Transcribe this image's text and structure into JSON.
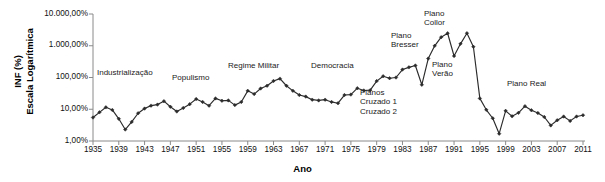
{
  "chart_data": {
    "type": "line",
    "title": "",
    "xlabel": "Ano",
    "ylabel": "INF (%)\nEscala Logarítmica",
    "ylabel_lines": [
      "INF (%)",
      "Escala Logarítmica"
    ],
    "yscale": "log",
    "ylim": [
      1,
      10000
    ],
    "xlim": [
      1935,
      2011
    ],
    "grid": false,
    "legend": null,
    "ytick_labels": [
      "10.000,00%",
      "1.000,00%",
      "100,00%",
      "10,00%",
      "1,00%"
    ],
    "ytick_values": [
      10000,
      1000,
      100,
      10,
      1
    ],
    "xtick_labels": [
      "1935",
      "1939",
      "1943",
      "1947",
      "1951",
      "1955",
      "1959",
      "1963",
      "1967",
      "1971",
      "1975",
      "1979",
      "1983",
      "1987",
      "1991",
      "1995",
      "1999",
      "2003",
      "2007",
      "2011"
    ],
    "xtick_values": [
      1935,
      1939,
      1943,
      1947,
      1951,
      1955,
      1959,
      1963,
      1967,
      1971,
      1975,
      1979,
      1983,
      1987,
      1991,
      1995,
      1999,
      2003,
      2007,
      2011
    ],
    "series_color": "#2b2b2b",
    "marker": "diamond",
    "x": [
      1935,
      1936,
      1937,
      1938,
      1939,
      1940,
      1941,
      1942,
      1943,
      1944,
      1945,
      1946,
      1947,
      1948,
      1949,
      1950,
      1951,
      1952,
      1953,
      1954,
      1955,
      1956,
      1957,
      1958,
      1959,
      1960,
      1961,
      1962,
      1963,
      1964,
      1965,
      1966,
      1967,
      1968,
      1969,
      1970,
      1971,
      1972,
      1973,
      1974,
      1975,
      1976,
      1977,
      1978,
      1979,
      1980,
      1981,
      1982,
      1983,
      1984,
      1985,
      1986,
      1987,
      1988,
      1989,
      1990,
      1991,
      1992,
      1993,
      1994,
      1995,
      1996,
      1997,
      1998,
      1999,
      2000,
      2001,
      2002,
      2003,
      2004,
      2005,
      2006,
      2007,
      2008,
      2009,
      2010,
      2011
    ],
    "values": [
      5.5,
      8.0,
      11.5,
      9.5,
      5.0,
      2.3,
      4.0,
      7.5,
      10.5,
      13.0,
      14.0,
      18.0,
      12.0,
      8.5,
      11.0,
      14.5,
      21.0,
      17.0,
      13.0,
      22.0,
      18.5,
      19.0,
      13.5,
      17.0,
      38.0,
      30.0,
      45.0,
      55.0,
      78.0,
      92.0,
      55.0,
      38.0,
      28.0,
      25.0,
      20.0,
      19.0,
      20.0,
      17.0,
      15.5,
      28.0,
      29.0,
      46.0,
      39.0,
      40.0,
      77.0,
      110.0,
      95.0,
      100.0,
      178.0,
      209.0,
      239.0,
      59.0,
      395.0,
      993.0,
      1863.0,
      2477.0,
      475.0,
      1149.0,
      2489.0,
      929.0,
      22.0,
      9.6,
      5.2,
      1.7,
      8.9,
      6.0,
      7.7,
      12.5,
      9.3,
      7.6,
      5.7,
      3.1,
      4.5,
      5.9,
      4.3,
      5.9,
      6.5
    ],
    "series": [
      {
        "name": "INF (%)",
        "values": [
          5.5,
          8.0,
          11.5,
          9.5,
          5.0,
          2.3,
          4.0,
          7.5,
          10.5,
          13.0,
          14.0,
          18.0,
          12.0,
          8.5,
          11.0,
          14.5,
          21.0,
          17.0,
          13.0,
          22.0,
          18.5,
          19.0,
          13.5,
          17.0,
          38.0,
          30.0,
          45.0,
          55.0,
          78.0,
          92.0,
          55.0,
          38.0,
          28.0,
          25.0,
          20.0,
          19.0,
          20.0,
          17.0,
          15.5,
          28.0,
          29.0,
          46.0,
          39.0,
          40.0,
          77.0,
          110.0,
          95.0,
          100.0,
          178.0,
          209.0,
          239.0,
          59.0,
          395.0,
          993.0,
          1863.0,
          2477.0,
          475.0,
          1149.0,
          2489.0,
          929.0,
          22.0,
          9.6,
          5.2,
          1.7,
          8.9,
          6.0,
          7.7,
          12.5,
          9.3,
          7.6,
          5.7,
          3.1,
          4.5,
          5.9,
          4.3,
          5.9,
          6.5
        ]
      }
    ],
    "annotations": [
      {
        "text": "Industrialização",
        "x_px": 97,
        "y_px": 68,
        "align": "left"
      },
      {
        "text": "Populismo",
        "x_px": 172,
        "y_px": 73,
        "align": "left"
      },
      {
        "text": "Regime Militar",
        "x_px": 228,
        "y_px": 61,
        "align": "left"
      },
      {
        "text": "Democracia",
        "x_px": 311,
        "y_px": 61,
        "align": "left"
      },
      {
        "text": "Planos\nCruzado 1\nCruzado 2",
        "x_px": 360,
        "y_px": 88,
        "align": "left"
      },
      {
        "text": "Plano\nBresser",
        "x_px": 391,
        "y_px": 31,
        "align": "left"
      },
      {
        "text": "Plano\nCollor",
        "x_px": 424,
        "y_px": 9,
        "align": "left"
      },
      {
        "text": "Plano\nVerão",
        "x_px": 432,
        "y_px": 60,
        "align": "left"
      },
      {
        "text": "Plano Real",
        "x_px": 507,
        "y_px": 79,
        "align": "left"
      }
    ]
  },
  "axis": {
    "x_title": "Ano",
    "y_title_line1": "INF (%)",
    "y_title_line2": "Escala Logarítmica"
  }
}
